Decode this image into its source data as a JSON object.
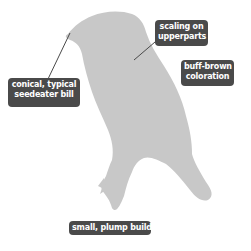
{
  "figure": {
    "silhouette_color": "#c8c8c8",
    "label_bg_color": "#4a4a4a",
    "label_text_color": "#ffffff",
    "leader_color": "#4a4a4a"
  },
  "labels": [
    {
      "id": "bill",
      "lines": [
        "conical, typical",
        "seedeater bill"
      ]
    },
    {
      "id": "scaling",
      "lines": [
        "scaling on",
        "upperparts"
      ]
    },
    {
      "id": "coloration",
      "lines": [
        "buff-brown",
        "coloration"
      ]
    },
    {
      "id": "build",
      "lines": [
        "small, plump build"
      ]
    }
  ]
}
